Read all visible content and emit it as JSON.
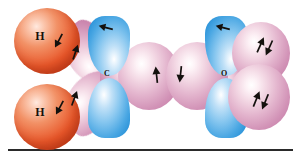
{
  "figure": {
    "background_color": "#ffffff",
    "width": 293,
    "height": 156
  },
  "palette": {
    "hydrogen_sphere": "#e8572a",
    "hybrid_lobe_pink": "#d293b7",
    "p_orbital_blue": "#4aa7e3",
    "arrow_black": "#14110e",
    "rule_color": "#2a2a2a",
    "label_color": "#1a1008"
  },
  "atoms": [
    {
      "id": "h-top",
      "label": "H",
      "element": "hydrogen",
      "color": "#e8572a"
    },
    {
      "id": "h-bottom",
      "label": "H",
      "element": "hydrogen",
      "color": "#e8572a"
    },
    {
      "id": "c-center",
      "label": "C",
      "element": "carbon",
      "color": "#d293b7"
    },
    {
      "id": "o-right",
      "label": "O",
      "element": "oxygen",
      "color": "#d293b7"
    }
  ],
  "orbitals": [
    {
      "id": "c-p-top",
      "kind": "p-orbital",
      "color": "#4aa7e3",
      "atom": "C"
    },
    {
      "id": "c-p-bottom",
      "kind": "p-orbital",
      "color": "#4aa7e3",
      "atom": "C"
    },
    {
      "id": "o-p-top",
      "kind": "p-orbital",
      "color": "#4aa7e3",
      "atom": "O"
    },
    {
      "id": "o-p-bottom",
      "kind": "p-orbital",
      "color": "#4aa7e3",
      "atom": "O"
    },
    {
      "id": "c-sp2-h-top",
      "kind": "sp2-hybrid",
      "color": "#d293b7",
      "atom": "C"
    },
    {
      "id": "c-sp2-h-bottom",
      "kind": "sp2-hybrid",
      "color": "#d293b7",
      "atom": "C"
    },
    {
      "id": "c-sp2-sigma",
      "kind": "sp2-hybrid",
      "color": "#d293b7",
      "atom": "C"
    },
    {
      "id": "o-sp2-sigma",
      "kind": "sp2-hybrid",
      "color": "#d293b7",
      "atom": "O"
    },
    {
      "id": "o-lone-pair-top",
      "kind": "sp2-lone-pair",
      "color": "#d293b7",
      "atom": "O"
    },
    {
      "id": "o-lone-pair-bottom",
      "kind": "sp2-lone-pair",
      "color": "#d293b7",
      "atom": "O"
    }
  ],
  "electron_spins": [
    {
      "id": "spin-h-top",
      "direction": "down",
      "pair": false
    },
    {
      "id": "spin-h-bottom",
      "direction": "down",
      "pair": false
    },
    {
      "id": "spin-c-hybrid-top",
      "direction": "up",
      "pair": false
    },
    {
      "id": "spin-c-hybrid-bottom",
      "direction": "up",
      "pair": false
    },
    {
      "id": "spin-c-p-top",
      "direction": "right",
      "pair": false
    },
    {
      "id": "spin-o-p-top",
      "direction": "right",
      "pair": false
    },
    {
      "id": "spin-sigma-left",
      "direction": "up",
      "pair": false
    },
    {
      "id": "spin-sigma-right",
      "direction": "down",
      "pair": false
    },
    {
      "id": "spin-lone-pair-top",
      "direction": "up-down",
      "pair": true
    },
    {
      "id": "spin-lone-pair-bottom",
      "direction": "up-down",
      "pair": true
    }
  ]
}
